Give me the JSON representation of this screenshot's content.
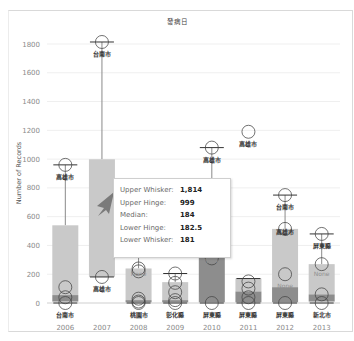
{
  "chart_data": {
    "type": "box",
    "title": "發病日",
    "xlabel": "",
    "ylabel": "Number of Records",
    "ylim": [
      0,
      1800
    ],
    "yticks": [
      0,
      200,
      400,
      600,
      800,
      1000,
      1200,
      1400,
      1600,
      1800
    ],
    "grid": true,
    "categories": [
      "2006",
      "2007",
      "2008",
      "2009",
      "2010",
      "2011",
      "2012",
      "2013"
    ],
    "boxes": [
      {
        "year": "2006",
        "upper_whisker": 960,
        "upper_hinge": 540,
        "median": 55,
        "lower_hinge": 10,
        "lower_whisker": 0,
        "points": [
          960,
          110,
          40,
          0
        ],
        "labels": [
          {
            "text": "高雄市",
            "value": 960,
            "pos": "below"
          },
          {
            "text": "台南市",
            "value": 0,
            "pos": "below"
          }
        ]
      },
      {
        "year": "2007",
        "upper_whisker": 1814,
        "upper_hinge": 999,
        "median": 184,
        "lower_hinge": 182.5,
        "lower_whisker": 181,
        "points": [
          1814,
          181
        ],
        "labels": [
          {
            "text": "台南市",
            "value": 1814,
            "pos": "below"
          },
          {
            "text": "高雄市",
            "value": 181,
            "pos": "below"
          }
        ]
      },
      {
        "year": "2008",
        "upper_whisker": 440,
        "upper_hinge": 240,
        "median": 20,
        "lower_hinge": 5,
        "lower_whisker": 0,
        "points": [
          440,
          240,
          220,
          30,
          10,
          0
        ],
        "labels": [
          {
            "text": "高雄市",
            "value": 440,
            "pos": "below"
          },
          {
            "text": "None",
            "value": 200,
            "pos": "center"
          },
          {
            "text": "桃園市",
            "value": 0,
            "pos": "below"
          }
        ]
      },
      {
        "year": "2009",
        "upper_whisker": 205,
        "upper_hinge": 145,
        "median": 20,
        "lower_hinge": 5,
        "lower_whisker": 0,
        "points": [
          205,
          140,
          75,
          20,
          0
        ],
        "labels": [
          {
            "text": "彰化縣",
            "value": 0,
            "pos": "below"
          }
        ]
      },
      {
        "year": "2010",
        "upper_whisker": 1080,
        "upper_hinge": 490,
        "median": 320,
        "lower_hinge": 5,
        "lower_whisker": 0,
        "points": [
          1080,
          490,
          420,
          310,
          0
        ],
        "labels": [
          {
            "text": "高雄市",
            "value": 1080,
            "pos": "below"
          },
          {
            "text": "台南市",
            "value": 460,
            "pos": "center"
          },
          {
            "text": "None",
            "value": 290,
            "pos": "center"
          },
          {
            "text": "屏東縣",
            "value": 0,
            "pos": "below"
          }
        ]
      },
      {
        "year": "2011",
        "upper_whisker": 170,
        "upper_hinge": 170,
        "median": 80,
        "lower_hinge": 5,
        "lower_whisker": 0,
        "points": [
          1190,
          150,
          100,
          40,
          0
        ],
        "labels": [
          {
            "text": "高雄市",
            "value": 1190,
            "pos": "below"
          },
          {
            "text": "屏東縣",
            "value": 0,
            "pos": "below"
          }
        ]
      },
      {
        "year": "2012",
        "upper_whisker": 750,
        "upper_hinge": 515,
        "median": 110,
        "lower_hinge": 5,
        "lower_whisker": 0,
        "points": [
          750,
          515,
          200,
          0
        ],
        "labels": [
          {
            "text": "台南市",
            "value": 750,
            "pos": "below"
          },
          {
            "text": "高雄市",
            "value": 490,
            "pos": "center"
          },
          {
            "text": "None",
            "value": 120,
            "pos": "center"
          },
          {
            "text": "屏東縣",
            "value": 0,
            "pos": "below"
          }
        ]
      },
      {
        "year": "2013",
        "upper_whisker": 480,
        "upper_hinge": 270,
        "median": 60,
        "lower_hinge": 10,
        "lower_whisker": 0,
        "points": [
          480,
          270,
          60,
          0
        ],
        "labels": [
          {
            "text": "屏東縣",
            "value": 480,
            "pos": "below"
          },
          {
            "text": "None",
            "value": 200,
            "pos": "center"
          },
          {
            "text": "新北市",
            "value": 0,
            "pos": "below"
          }
        ]
      }
    ],
    "tooltip": {
      "year": "2007",
      "rows": [
        {
          "label": "Upper Whisker:",
          "value": "1,814"
        },
        {
          "label": "Upper Hinge:",
          "value": "999"
        },
        {
          "label": "Median:",
          "value": "184"
        },
        {
          "label": "Lower Hinge:",
          "value": "182.5"
        },
        {
          "label": "Lower Whisker:",
          "value": "181"
        }
      ]
    },
    "colors": {
      "box_upper": "#c9c9c9",
      "box_lower": "#8d8d8d",
      "whisker": "#555555",
      "gridline": "#efefef",
      "axis": "#cfcfcf"
    }
  }
}
